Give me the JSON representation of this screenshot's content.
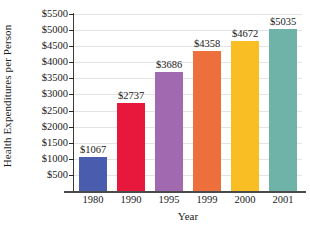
{
  "chart_data": {
    "type": "bar",
    "title": "",
    "xlabel": "Year",
    "ylabel": "Health Expenditures per Person",
    "categories": [
      "1980",
      "1990",
      "1995",
      "1999",
      "2000",
      "2001"
    ],
    "values": [
      1067,
      2737,
      3686,
      4358,
      4672,
      5035
    ],
    "value_labels": [
      "$1067",
      "$2737",
      "$3686",
      "$4358",
      "$4672",
      "$5035"
    ],
    "ylim": [
      0,
      5500
    ],
    "ytick_values": [
      500,
      1000,
      1500,
      2000,
      2500,
      3000,
      3500,
      4000,
      4500,
      5000,
      5500
    ],
    "ytick_labels": [
      "$500",
      "$1000",
      "$1500",
      "$2000",
      "$2500",
      "$3000",
      "$3500",
      "$4000",
      "$4500",
      "$5000",
      "$5500"
    ],
    "grid": true,
    "legend": null,
    "bar_colors": [
      "#4a5cad",
      "#e8183c",
      "#a069b0",
      "#ed6f3c",
      "#f9be24",
      "#6fb3a8"
    ]
  },
  "colors": {
    "axis": "#3a3a3a",
    "gridline": "#e4e4e8",
    "text": "#1a1a1a",
    "background": "#ffffff"
  }
}
